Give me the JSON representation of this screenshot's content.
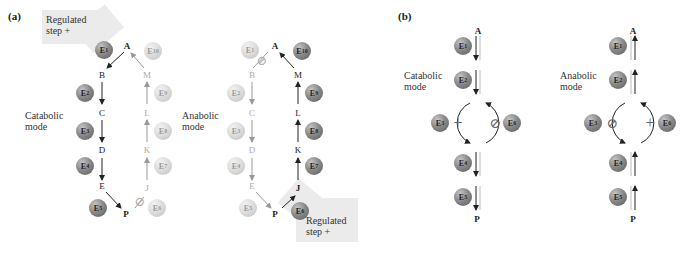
{
  "panel_a": {
    "label": "(a)",
    "catabolic": {
      "mode_label": [
        "Catabolic",
        "mode"
      ],
      "regulated_label": [
        "Regulated",
        "step +"
      ],
      "nodes": [
        "A",
        "B",
        "C",
        "D",
        "E",
        "P",
        "J",
        "K",
        "L",
        "M"
      ],
      "enzymes": [
        "E1",
        "E2",
        "E3",
        "E4",
        "E5",
        "E6",
        "E7",
        "E8",
        "E9",
        "E10"
      ],
      "active_enzymes": [
        "E1",
        "E2",
        "E3",
        "E4",
        "E5"
      ],
      "inhibited_symbol": "⊘"
    },
    "anabolic": {
      "mode_label": [
        "Anabolic",
        "mode"
      ],
      "regulated_label": [
        "Regulated",
        "step +"
      ],
      "nodes": [
        "A",
        "B",
        "C",
        "D",
        "E",
        "P",
        "J",
        "K",
        "L",
        "M"
      ],
      "enzymes": [
        "E1",
        "E2",
        "E3",
        "E4",
        "E5",
        "E6",
        "E7",
        "E8",
        "E9",
        "E10"
      ],
      "active_enzymes": [
        "E6",
        "E7",
        "E8",
        "E9",
        "E10"
      ],
      "inhibited_symbol": "⊘"
    }
  },
  "panel_b": {
    "label": "(b)",
    "catabolic": {
      "mode_label": [
        "Catabolic",
        "mode"
      ],
      "top_node": "A",
      "bottom_node": "P",
      "enzymes": [
        "E1",
        "E2",
        "E3",
        "E6",
        "E4",
        "E5"
      ],
      "activator": "+",
      "inhibitor": "⊘"
    },
    "anabolic": {
      "mode_label": [
        "Anabolic",
        "mode"
      ],
      "top_node": "A",
      "bottom_node": "P",
      "enzymes": [
        "E1",
        "E2",
        "E3",
        "E6",
        "E4",
        "E5"
      ],
      "activator": "+",
      "inhibitor": "⊘"
    }
  },
  "colors": {
    "active_enzyme": "#6e6e6e",
    "inactive_enzyme": "#d4d4d4",
    "highlight": "#ebebeb",
    "arrow": "#222222",
    "faint": "#aaaaaa"
  }
}
